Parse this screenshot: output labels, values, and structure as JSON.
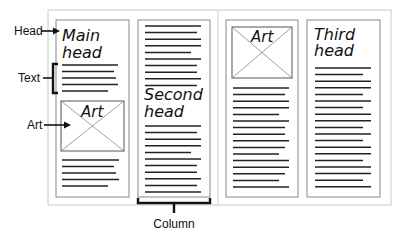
{
  "callouts": {
    "head": "Head",
    "text": "Text",
    "art": "Art",
    "column": "Column"
  },
  "columns": [
    {
      "heading": [
        "Main",
        "head"
      ],
      "art_label": "Art"
    },
    {
      "heading": [
        "Second",
        "head"
      ]
    },
    {
      "art_label": "Art"
    },
    {
      "heading": [
        "Third",
        "head"
      ]
    }
  ],
  "colors": {
    "line": "#222222",
    "frame": "#c8c8c8",
    "column_border": "#888888"
  }
}
